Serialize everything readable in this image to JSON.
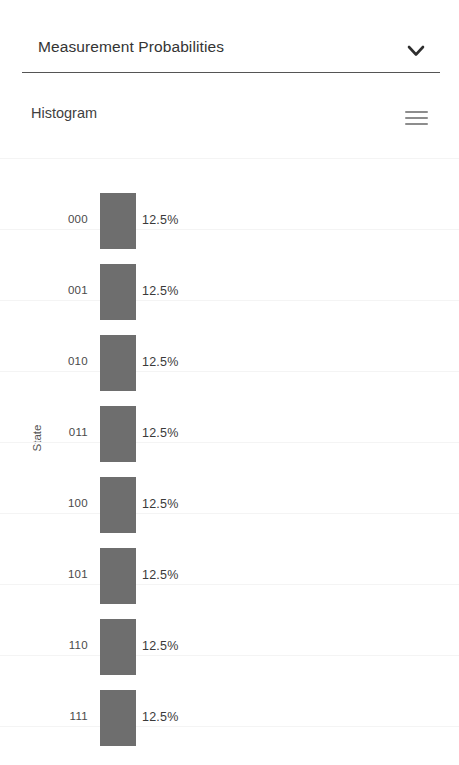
{
  "panel": {
    "title": "Measurement Probabilities",
    "collapse_icon": "chevron-down-icon",
    "expanded": true
  },
  "chart_header": {
    "title": "Histogram",
    "menu_icon": "hamburger-menu-icon"
  },
  "chart_data": {
    "type": "bar",
    "orientation": "horizontal",
    "title": "Histogram",
    "xlabel": "",
    "ylabel": "State",
    "categories": [
      "000",
      "001",
      "010",
      "011",
      "100",
      "101",
      "110",
      "111"
    ],
    "values": [
      12.5,
      12.5,
      12.5,
      12.5,
      12.5,
      12.5,
      12.5,
      12.5
    ],
    "value_labels": [
      "12.5%",
      "12.5%",
      "12.5%",
      "12.5%",
      "12.5%",
      "12.5%",
      "12.5%",
      "12.5%"
    ],
    "xlim": [
      0,
      100
    ],
    "grid": false,
    "legend": false,
    "bar_color": "#6e6e6e"
  },
  "colors": {
    "bar": "#6e6e6e",
    "text": "#3c3c3c",
    "divider": "#555555",
    "background": "#ffffff",
    "menu_icon": "#8d8d8d"
  }
}
